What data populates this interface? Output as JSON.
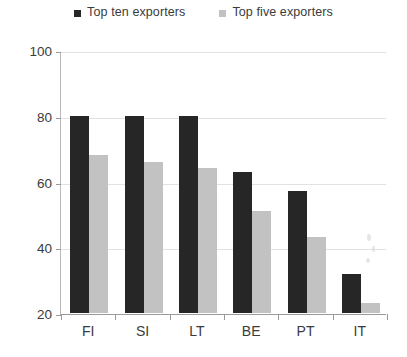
{
  "chart_data": {
    "type": "bar",
    "title": "",
    "xlabel": "",
    "ylabel": "",
    "categories": [
      "FI",
      "SI",
      "LT",
      "BE",
      "PT",
      "IT"
    ],
    "series": [
      {
        "name": "Top ten exporters",
        "color": "#262626",
        "values": [
          80,
          80,
          80,
          63,
          57,
          32
        ]
      },
      {
        "name": "Top five exporters",
        "color": "#c2c2c2",
        "values": [
          68,
          66,
          64,
          51,
          43,
          23
        ]
      }
    ],
    "ylim": [
      20,
      100
    ],
    "yticks": [
      20,
      40,
      60,
      80,
      100
    ],
    "ytick_labels": [
      "20",
      "40",
      "60",
      "80",
      "100"
    ],
    "grid": true,
    "legend_position": "top-center"
  },
  "legend": {
    "entries": [
      {
        "label": "Top ten exporters",
        "swatch": "#262626"
      },
      {
        "label": "Top five exporters",
        "swatch": "#c2c2c2"
      }
    ]
  },
  "colors": {
    "series_dark": "#262626",
    "series_light": "#c2c2c2",
    "axis": "#9a9a9a",
    "grid": "#e2e2e2",
    "text": "#3b3b3b",
    "background": "#ffffff"
  }
}
